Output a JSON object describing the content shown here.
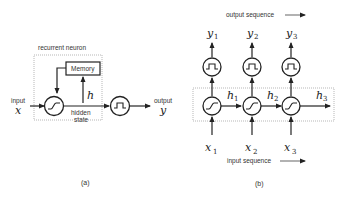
{
  "panel_a": {
    "box_label": "recurrent neuron",
    "memory_label": "Memory",
    "input_label": "input",
    "input_var": "x",
    "hidden_var": "h",
    "hidden_label_1": "hidden",
    "hidden_label_2": "state",
    "output_label": "output",
    "output_var": "y",
    "caption": "(a)"
  },
  "panel_b": {
    "output_sequence_label": "output sequence",
    "input_sequence_label": "input sequence",
    "caption": "(b)",
    "steps": [
      {
        "y": "y",
        "y_sub": "1",
        "h": "h",
        "h_sub": "1",
        "x": "x",
        "x_sub": "1"
      },
      {
        "y": "y",
        "y_sub": "2",
        "h": "h",
        "h_sub": "2",
        "x": "x",
        "x_sub": "2"
      },
      {
        "y": "y",
        "y_sub": "3",
        "h": "h",
        "h_sub": "3",
        "x": "x",
        "x_sub": "3"
      }
    ]
  }
}
